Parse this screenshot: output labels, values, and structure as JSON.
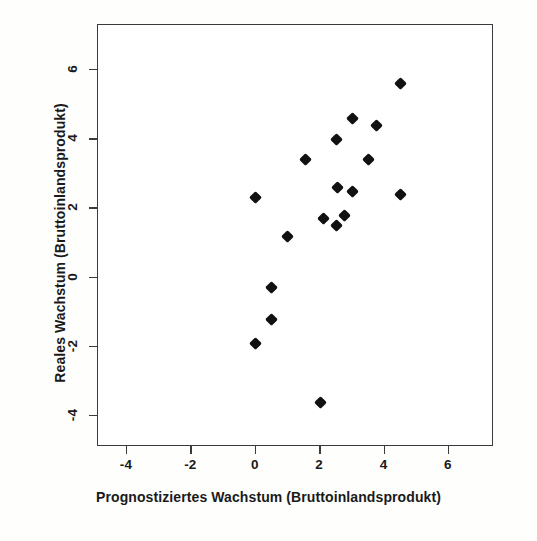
{
  "figure": {
    "background_color": "#fefefd",
    "frame_color": "#3a3a38",
    "point_color": "#111111"
  },
  "chart_data": {
    "type": "scatter",
    "title": "",
    "xlabel": "Prognostiziertes Wachstum (Bruttoinlandsprodukt)",
    "ylabel": "Reales Wachstum (Bruttoinlandsprodukt)",
    "xlim": [
      -4.9,
      7.4
    ],
    "ylim": [
      -4.9,
      7.3
    ],
    "xticks": [
      -4,
      -2,
      0,
      2,
      4,
      6
    ],
    "xticklabels": [
      "-4",
      "-2",
      "0",
      "2",
      "4",
      "6"
    ],
    "yticks": [
      -4,
      -2,
      0,
      2,
      4,
      6
    ],
    "yticklabels": [
      "-4",
      "-2",
      "0",
      "2",
      "4",
      "6"
    ],
    "grid": false,
    "legend": null,
    "marker": "diamond",
    "points": [
      {
        "x": 4.5,
        "y": 5.6
      },
      {
        "x": 3.0,
        "y": 4.6
      },
      {
        "x": 3.75,
        "y": 4.4
      },
      {
        "x": 2.5,
        "y": 4.0
      },
      {
        "x": 1.55,
        "y": 3.4
      },
      {
        "x": 3.5,
        "y": 3.4
      },
      {
        "x": 2.55,
        "y": 2.6
      },
      {
        "x": 3.0,
        "y": 2.5
      },
      {
        "x": 4.5,
        "y": 2.4
      },
      {
        "x": 0.0,
        "y": 2.3
      },
      {
        "x": 2.75,
        "y": 1.8
      },
      {
        "x": 2.1,
        "y": 1.7
      },
      {
        "x": 2.5,
        "y": 1.5
      },
      {
        "x": 1.0,
        "y": 1.2
      },
      {
        "x": 0.5,
        "y": -0.3
      },
      {
        "x": 0.5,
        "y": -1.2
      },
      {
        "x": 0.0,
        "y": -1.9
      },
      {
        "x": 2.0,
        "y": -3.6
      }
    ]
  }
}
